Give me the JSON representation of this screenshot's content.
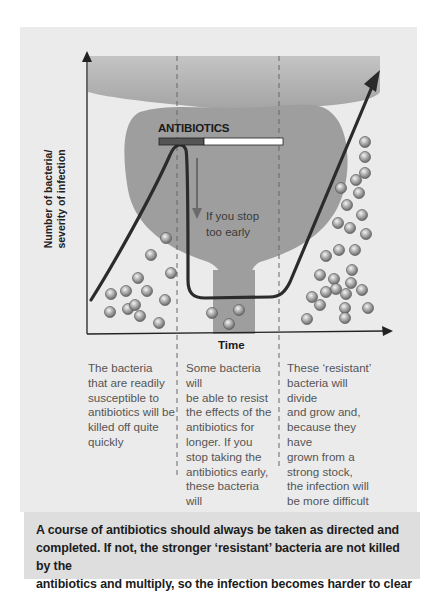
{
  "diagram": {
    "y_axis_label_line1": "Number of bacteria/",
    "y_axis_label_line2": "severity of infection",
    "x_axis_label": "Time",
    "antibiotics_label": "ANTIBIOTICS",
    "stop_annotation_line1": "If you stop",
    "stop_annotation_line2": "too early",
    "colors": {
      "panel_background": "#ebebeb",
      "footer_background": "#dedede",
      "prostate_shape": "#9e9e9e",
      "bowl_top": "#b0b0b0",
      "curve": "#2b2b2b",
      "bar_dark": "#555555",
      "bar_light": "#ffffff",
      "bacteria": "#a8a8a8"
    },
    "phases": [
      {
        "name": "susceptible",
        "description": "The bacteria that are readily susceptible to antibiotics will be killed off quite quickly"
      },
      {
        "name": "resisting",
        "description": "Some bacteria will be able to resist the effects of the antibiotics for longer. If you stop taking the antibiotics early, these bacteria will still be in your prostate"
      },
      {
        "name": "resistant-growth",
        "description": "These 'resistant' bacteria will divide and grow and, because they have grown from a strong stock, the infection will be more difficult to treat"
      }
    ],
    "column_lines": {
      "col1": [
        "The bacteria",
        "that are readily",
        "susceptible to",
        "antibiotics will be",
        "killed off quite",
        "quickly"
      ],
      "col2": [
        "Some bacteria will",
        "be able to resist",
        "the effects of the",
        "antibiotics for",
        "longer. If you",
        "stop taking the",
        "antibiotics early,",
        "these bacteria will",
        "still be in your",
        "prostate"
      ],
      "col3": [
        "These ‘resistant’",
        "bacteria will divide",
        "and grow and,",
        "because they have",
        "grown from a",
        "strong stock,",
        "the infection will",
        "be more difficult",
        "to treat"
      ]
    }
  },
  "footer": {
    "line1": "A course of antibiotics should always be taken as directed and",
    "line2": "completed. If not, the stronger ‘resistant’ bacteria are not killed by the",
    "line3": "antibiotics and multiply, so the infection becomes harder to clear"
  }
}
